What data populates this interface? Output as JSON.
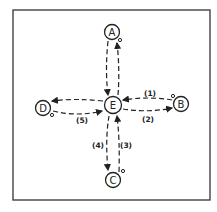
{
  "diagram": {
    "type": "star-network",
    "frame": {
      "x": 13,
      "y": 10,
      "width": 197,
      "height": 190
    },
    "nodes": [
      {
        "id": "A",
        "label": "A",
        "x": 112,
        "y": 32
      },
      {
        "id": "B",
        "label": "B",
        "x": 181,
        "y": 104
      },
      {
        "id": "C",
        "label": "C",
        "x": 113,
        "y": 180
      },
      {
        "id": "D",
        "label": "D",
        "x": 43,
        "y": 108
      },
      {
        "id": "E",
        "label": "E",
        "x": 113,
        "y": 105
      }
    ],
    "edges": [
      {
        "from": "A",
        "to": "E",
        "label": ""
      },
      {
        "from": "E",
        "to": "A",
        "label": ""
      },
      {
        "from": "B",
        "to": "E",
        "label": "(1)"
      },
      {
        "from": "E",
        "to": "B",
        "label": "(2)"
      },
      {
        "from": "C",
        "to": "E",
        "label": "(3)"
      },
      {
        "from": "E",
        "to": "C",
        "label": "(4)"
      },
      {
        "from": "E",
        "to": "D",
        "label": ""
      },
      {
        "from": "D",
        "to": "E",
        "label": "(5)"
      }
    ]
  }
}
